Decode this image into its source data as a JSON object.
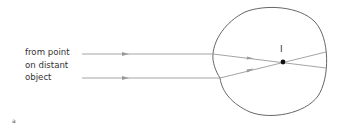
{
  "labels": {
    "source_line1": "from point",
    "source_line2": "on distant",
    "source_line3": "object",
    "focus": "I",
    "corner": "a"
  },
  "colors": {
    "ray": "#9a9a9a",
    "eye_outline": "#666666",
    "focus_point": "#111111",
    "text": "#333333"
  },
  "rays": [
    {
      "name": "upper-ray",
      "outside": [
        [
          82,
          54
        ],
        [
          213,
          54
        ]
      ],
      "inside": [
        [
          213,
          54
        ],
        [
          326,
          68
        ]
      ],
      "arrow_outside_x": 125,
      "arrow_inside_x": 250
    },
    {
      "name": "lower-ray",
      "outside": [
        [
          82,
          78
        ],
        [
          220,
          78
        ]
      ],
      "inside": [
        [
          220,
          78
        ],
        [
          326,
          52
        ]
      ],
      "arrow_outside_x": 125,
      "arrow_inside_x": 250
    }
  ],
  "focus_point": {
    "x": 283,
    "y": 62
  }
}
